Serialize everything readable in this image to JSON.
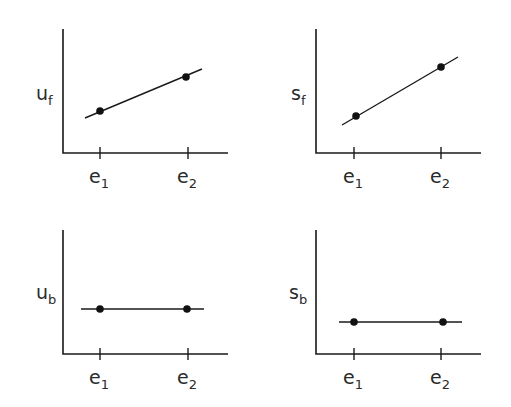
{
  "panels": [
    {
      "id": "uf",
      "ylabel": "u",
      "ylabel_sub": "f",
      "xticks": [
        {
          "main": "e",
          "sub": "1"
        },
        {
          "main": "e",
          "sub": "2"
        }
      ],
      "trend": "increasing"
    },
    {
      "id": "sf",
      "ylabel": "s",
      "ylabel_sub": "f",
      "xticks": [
        {
          "main": "e",
          "sub": "1"
        },
        {
          "main": "e",
          "sub": "2"
        }
      ],
      "trend": "increasing"
    },
    {
      "id": "ub",
      "ylabel": "u",
      "ylabel_sub": "b",
      "xticks": [
        {
          "main": "e",
          "sub": "1"
        },
        {
          "main": "e",
          "sub": "2"
        }
      ],
      "trend": "flat"
    },
    {
      "id": "sb",
      "ylabel": "s",
      "ylabel_sub": "b",
      "xticks": [
        {
          "main": "e",
          "sub": "1"
        },
        {
          "main": "e",
          "sub": "2"
        }
      ],
      "trend": "flat"
    }
  ],
  "colors": {
    "ink": "#1a1a1a",
    "background": "#ffffff"
  }
}
